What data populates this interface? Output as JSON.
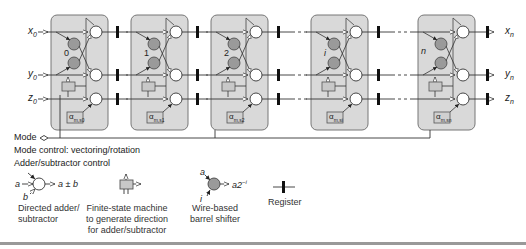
{
  "inputs": {
    "x": "x",
    "y": "y",
    "z": "z",
    "sub0": "0"
  },
  "outputs": {
    "x": "x",
    "y": "y",
    "z": "z",
    "subn": "n"
  },
  "stages": [
    {
      "shift_label": "0",
      "alpha": "α",
      "alpha_sub": "m,s0"
    },
    {
      "shift_label": "1",
      "alpha": "α",
      "alpha_sub": "m,s1"
    },
    {
      "shift_label": "2",
      "alpha": "α",
      "alpha_sub": "m,s2"
    },
    {
      "shift_label": "i",
      "alpha": "α",
      "alpha_sub": "m,si"
    },
    {
      "shift_label": "n",
      "alpha": "α",
      "alpha_sub": "m,sn"
    }
  ],
  "mode": {
    "label": "Mode",
    "line1": "Mode control: vectoring/rotation",
    "line2": "Adder/subtractor control"
  },
  "legend": {
    "adder": {
      "a": "a",
      "b": "b",
      "out": "a ± b",
      "caption1": "Directed adder/",
      "caption2": "subtractor"
    },
    "fsm": {
      "caption1": "Finite-state machine",
      "caption2": "to generate direction",
      "caption3": "for adder/subtractor"
    },
    "shifter": {
      "a": "a",
      "i": "i",
      "out": "a2",
      "out_exp": "−i",
      "caption1": "Wire-based",
      "caption2": "barrel shifter"
    },
    "register": {
      "caption": "Register"
    }
  },
  "colors": {
    "box_fill": "#d9d9d9",
    "box_stroke": "#777777",
    "shifter_fill": "#9a9a9a",
    "line": "#333333",
    "register": "#111111"
  }
}
